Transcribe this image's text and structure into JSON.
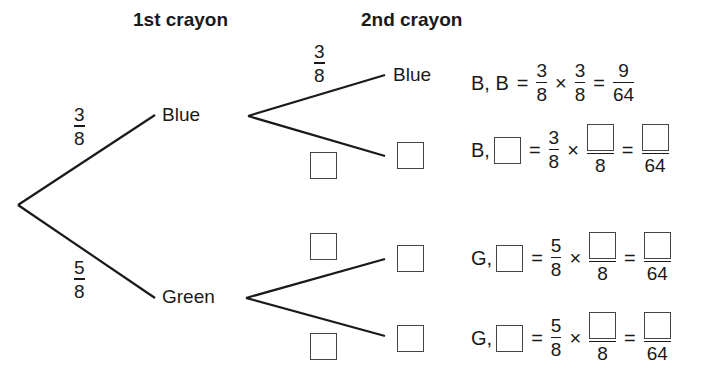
{
  "headers": {
    "first": "1st crayon",
    "second": "2nd crayon"
  },
  "tree": {
    "first_level": [
      {
        "label": "Blue",
        "prob_num": "3",
        "prob_den": "8"
      },
      {
        "label": "Green",
        "prob_num": "5",
        "prob_den": "8"
      }
    ],
    "second_level": {
      "blue_blue": {
        "label": "Blue",
        "prob_num": "3",
        "prob_den": "8"
      },
      "blue_other": {
        "label": "",
        "prob": "blank"
      },
      "green_first": {
        "label": "",
        "prob": "blank"
      },
      "green_second": {
        "label": "",
        "prob": "blank"
      }
    }
  },
  "equations": [
    {
      "left": "B, B",
      "eq": "=",
      "f1_num": "3",
      "f1_den": "8",
      "times": "×",
      "f2_num": "3",
      "f2_den": "8",
      "eq2": "=",
      "res_num": "9",
      "res_den": "64"
    },
    {
      "left": "B,",
      "eq": "=",
      "f1_num": "3",
      "f1_den": "8",
      "times": "×",
      "f2_den": "8",
      "eq2": "=",
      "res_den": "64"
    },
    {
      "left": "G,",
      "eq": "=",
      "f1_num": "5",
      "f1_den": "8",
      "times": "×",
      "f2_den": "8",
      "eq2": "=",
      "res_den": "64"
    },
    {
      "left": "G,",
      "eq": "=",
      "f1_num": "5",
      "f1_den": "8",
      "times": "×",
      "f2_den": "8",
      "eq2": "=",
      "res_den": "64"
    }
  ],
  "colors": {
    "line": "#1a1a1a",
    "box_border": "#444444",
    "background": "#ffffff"
  }
}
